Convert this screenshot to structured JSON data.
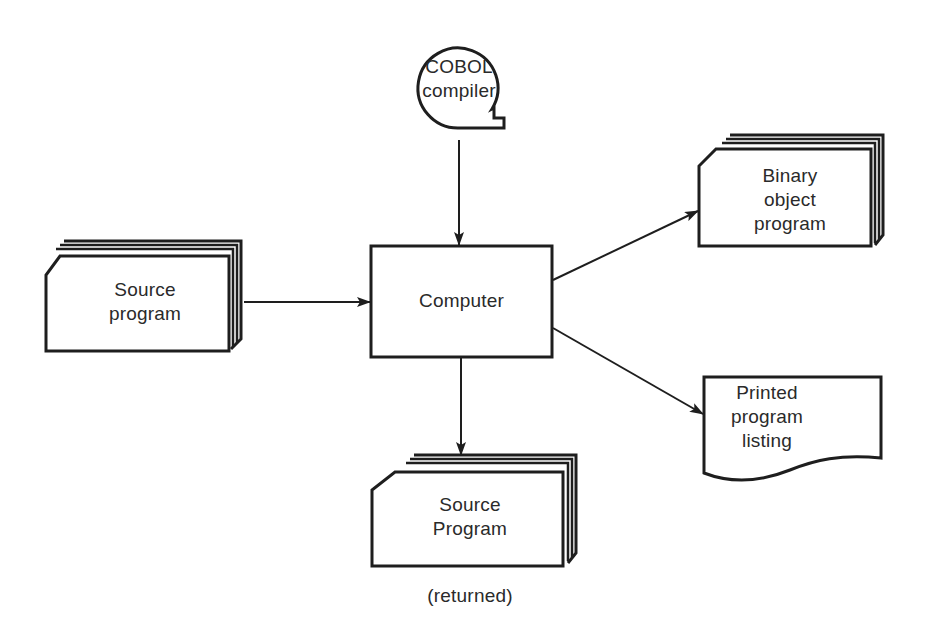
{
  "diagram": {
    "type": "flowchart",
    "nodes": {
      "compiler": {
        "shape": "magnetic-tape",
        "lines": [
          "COBOL",
          "compiler"
        ]
      },
      "source_in": {
        "shape": "card-deck",
        "lines": [
          "Source",
          "program"
        ]
      },
      "computer": {
        "shape": "process",
        "lines": [
          "Computer"
        ]
      },
      "binary": {
        "shape": "card-deck",
        "lines": [
          "Binary",
          "object",
          "program"
        ]
      },
      "listing": {
        "shape": "document",
        "lines": [
          "Printed",
          "program",
          "listing"
        ]
      },
      "source_out": {
        "shape": "card-deck",
        "lines": [
          "Source",
          "Program"
        ],
        "caption": "(returned)"
      }
    },
    "edges": [
      {
        "from": "compiler",
        "to": "computer"
      },
      {
        "from": "source_in",
        "to": "computer"
      },
      {
        "from": "computer",
        "to": "binary"
      },
      {
        "from": "computer",
        "to": "listing"
      },
      {
        "from": "computer",
        "to": "source_out"
      }
    ],
    "colors": {
      "stroke": "#1e1e1e",
      "fill": "#ffffff",
      "text": "#2a2a2a"
    }
  }
}
